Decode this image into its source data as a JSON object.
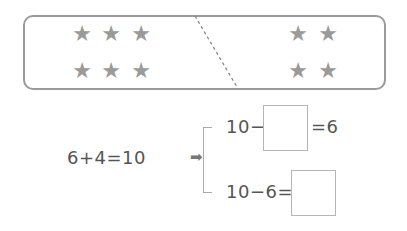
{
  "diagram": {
    "left_group": {
      "star_count": 6,
      "rows": 2,
      "cols": 3,
      "icon": "star-icon"
    },
    "right_group": {
      "star_count": 4,
      "rows": 2,
      "cols": 2,
      "icon": "star-icon"
    },
    "colors": {
      "star": "#9a9a9a",
      "border": "#9a9a9a",
      "text": "#555555"
    }
  },
  "equations": {
    "main": "6+4=10",
    "arrow": "➡",
    "top_left": "10−",
    "top_right": "=6",
    "bottom_left": "10−6=",
    "top_answer": "",
    "bottom_answer": ""
  },
  "stars": {
    "glyph": "★"
  }
}
